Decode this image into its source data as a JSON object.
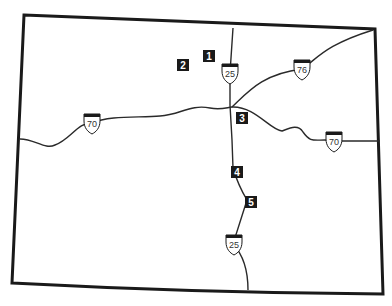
{
  "map": {
    "region": "Colorado",
    "colors": {
      "background": "#ffffff",
      "border": "#1a1a1a",
      "road": "#2a2a2a",
      "marker_fill": "#1a1a1a",
      "marker_text": "#ffffff",
      "shield_fill": "#ffffff",
      "shield_cap": "#1a1a1a"
    },
    "highways": [
      {
        "name": "I-25",
        "shields": [
          {
            "label": "25",
            "x": 230,
            "y": 73
          },
          {
            "label": "25",
            "x": 234,
            "y": 244
          }
        ]
      },
      {
        "name": "I-70",
        "shields": [
          {
            "label": "70",
            "x": 92,
            "y": 123
          },
          {
            "label": "70",
            "x": 334,
            "y": 141
          }
        ]
      },
      {
        "name": "I-76",
        "shields": [
          {
            "label": "76",
            "x": 302,
            "y": 69
          }
        ]
      }
    ],
    "markers": [
      {
        "label": "1",
        "x": 209,
        "y": 56
      },
      {
        "label": "2",
        "x": 183,
        "y": 65
      },
      {
        "label": "3",
        "x": 242,
        "y": 118
      },
      {
        "label": "4",
        "x": 237,
        "y": 172
      },
      {
        "label": "5",
        "x": 251,
        "y": 202
      }
    ]
  }
}
